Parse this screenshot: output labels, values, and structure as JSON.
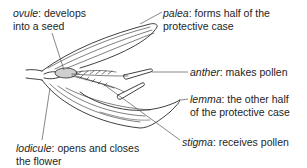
{
  "diagram": {
    "labels": {
      "ovule": {
        "term": "ovule",
        "desc_line1": ": develops",
        "desc_line2": "into a seed"
      },
      "palea": {
        "term": "palea",
        "desc_line1": ": forms half of the",
        "desc_line2": "protective case"
      },
      "anther": {
        "term": "anther",
        "desc_line1": ": makes pollen"
      },
      "lemma": {
        "term": "lemma",
        "desc_line1": ": the other half",
        "desc_line2": "of the protective case"
      },
      "stigma": {
        "term": "stigma",
        "desc_line1": ": receives pollen"
      },
      "lodicule": {
        "term": "lodicule",
        "desc_line1": ": opens and closes",
        "desc_line2": "the flower"
      }
    },
    "colors": {
      "ink": "#1e1e1e",
      "background": "#ffffff",
      "leader": "#555555"
    }
  }
}
